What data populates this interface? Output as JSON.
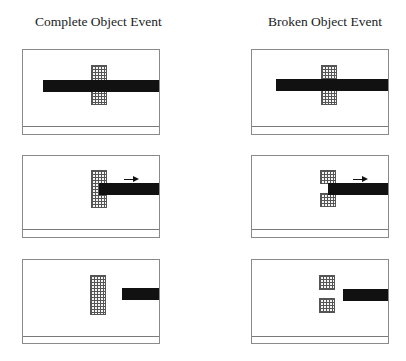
{
  "columns": [
    {
      "title": "Complete Object Event"
    },
    {
      "title": "Broken Object Event"
    }
  ],
  "rows": [
    {
      "stage": 1,
      "description": "bar passes behind occluder"
    },
    {
      "stage": 2,
      "description": "bar moving right, arrow indicates motion"
    },
    {
      "stage": 3,
      "description": "bar moved out from behind occluder"
    }
  ],
  "legend": {
    "bar_color": "#111111",
    "occluder_pattern": "stippled grid",
    "arrow": "motion-right-arrow"
  }
}
